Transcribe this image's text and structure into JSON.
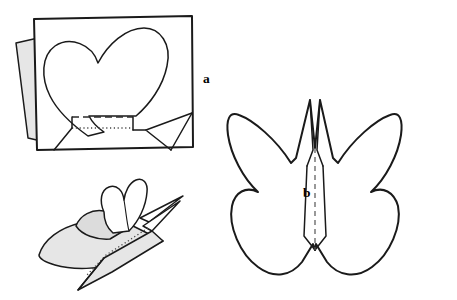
{
  "figure": {
    "kind": "craft-instruction-diagram",
    "background_color": "#ffffff",
    "ink_color": "#1a1a1a",
    "shade_color": "#e6e6e6",
    "panel_count": 3
  },
  "labels": [
    {
      "id": "a",
      "text": "a",
      "x": 203,
      "y": 72,
      "refers_to": "card-with-heart-panel"
    },
    {
      "id": "b",
      "text": "b",
      "x": 303,
      "y": 186,
      "refers_to": "butterfly-cutout-panel"
    }
  ],
  "panels": {
    "a": {
      "name": "card-with-heart-panel",
      "label": "a",
      "description": "Rectangular card, slightly rotated, with a heart outline drawn across it; a shaded flap folds out on the left edge and fold lines are marked along the lower edge.",
      "elements": [
        "card-rectangle",
        "heart-outline",
        "left-gray-flap",
        "bottom-dashed-fold-line",
        "bottom-dotted-fold-line",
        "lower-left-crease",
        "lower-right-crease"
      ]
    },
    "middle": {
      "name": "folded-butterfly-perspective",
      "label": "",
      "description": "Three-quarter perspective view of the finished folded butterfly resting with wings raised and a shaded under-wing.",
      "elements": [
        "raised-wing-outline",
        "shaded-lower-wing",
        "body-crease-dotted",
        "antenna-spikes",
        "tail-point"
      ]
    },
    "b": {
      "name": "butterfly-cutout-panel",
      "label": "b",
      "description": "Flat symmetrical butterfly cut-out seen head-on, with a dashed vertical centre fold line running down the body between the two antennae.",
      "elements": [
        "butterfly-outline",
        "left-wing",
        "right-wing",
        "body-column",
        "left-antenna",
        "right-antenna",
        "center-fold-dashed-line"
      ]
    }
  },
  "line_legend": {
    "solid": "cut or visible edge",
    "dashed": "fold line",
    "dotted": "hidden or scored fold line"
  }
}
